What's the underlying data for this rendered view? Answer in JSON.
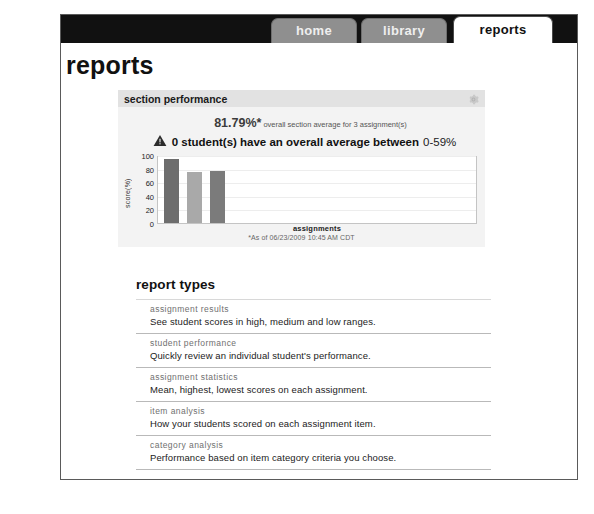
{
  "nav": {
    "tabs": [
      {
        "label": "home",
        "active": false
      },
      {
        "label": "library",
        "active": false
      },
      {
        "label": "reports",
        "active": true
      }
    ]
  },
  "page": {
    "title": "reports"
  },
  "section_performance": {
    "header_title": "section performance",
    "gear_icon": "gear-icon",
    "average_percent": "81.79%*",
    "average_text": "overall section average for 3 assignment(s)",
    "warning_icon": "warning-triangle-icon",
    "warning_bold": "0 student(s) have an overall average between",
    "warning_range": "0-59%",
    "as_of": "*As of 06/23/2009 10:45 AM CDT"
  },
  "chart_data": {
    "type": "bar",
    "title": "section performance",
    "categories": [
      "assignment 1",
      "assignment 2",
      "assignment 3"
    ],
    "values": [
      97,
      77,
      79
    ],
    "xlabel": "assignments",
    "ylabel": "score(%)",
    "ylim": [
      0,
      100
    ],
    "yticks": [
      0,
      20,
      40,
      60,
      80,
      100
    ],
    "grid": true,
    "legend": "none",
    "bar_colors": [
      "#6d6d6d",
      "#a9a9a9",
      "#7b7b7b"
    ]
  },
  "report_types": {
    "title": "report types",
    "items": [
      {
        "label": "assignment results",
        "description": "See student scores in high, medium and low ranges."
      },
      {
        "label": "student performance",
        "description": "Quickly review an individual student's performance."
      },
      {
        "label": "assignment statistics",
        "description": "Mean, highest, lowest scores on each assignment."
      },
      {
        "label": "item analysis",
        "description": "How your students scored on each assignment item."
      },
      {
        "label": "category analysis",
        "description": "Performance based on item category criteria you choose."
      }
    ]
  }
}
